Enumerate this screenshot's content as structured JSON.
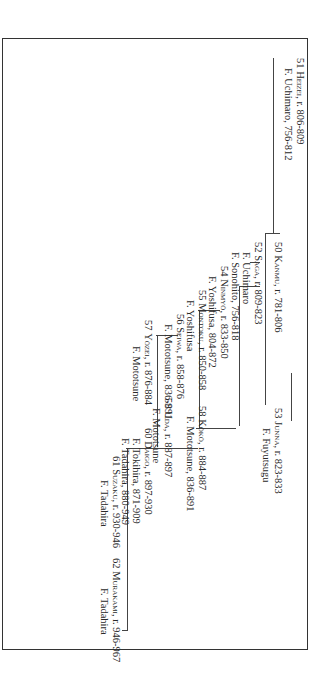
{
  "chart": {
    "rotation_deg": 90,
    "nodes": [
      {
        "id": "n50",
        "num": "50",
        "name": "Kanmu",
        "reign": "r. 781-806",
        "fujiwara": []
      },
      {
        "id": "n51",
        "num": "51",
        "name": "Heizei",
        "reign": "r. 806-809",
        "fujiwara": [
          "F. Uchimaro, 756-812"
        ]
      },
      {
        "id": "n52",
        "num": "52",
        "name": "Saga",
        "reign": "r. 809-823",
        "fujiwara": [
          "F. Uchimaro",
          "F. Sonohito, 756-818"
        ]
      },
      {
        "id": "n53",
        "num": "53",
        "name": "Junna",
        "reign": "r. 823-833",
        "fujiwara": [
          "F. Fuyutsugu"
        ]
      },
      {
        "id": "n54",
        "num": "54",
        "name": "Ninmyō",
        "reign": "r. 833-850",
        "fujiwara": [
          "F. Yoshifusa, 804-872"
        ]
      },
      {
        "id": "n55",
        "num": "55",
        "name": "Montoku",
        "reign": "r. 850-858",
        "fujiwara": [
          "F. Yoshifusa"
        ]
      },
      {
        "id": "n56",
        "num": "56",
        "name": "Seiwa",
        "reign": "r. 858-876",
        "fujiwara": [
          "F. Mototsune, 836-891"
        ]
      },
      {
        "id": "n57",
        "num": "57",
        "name": "Yōzei",
        "reign": "r. 876-884",
        "fujiwara": [
          "F. Mototsune"
        ]
      },
      {
        "id": "n58",
        "num": "58",
        "name": "Kōkō",
        "reign": "r. 884-887",
        "fujiwara": [
          "F. Mototsune, 836-891"
        ]
      },
      {
        "id": "n59",
        "num": "59",
        "name": "Uda",
        "reign": "r. 887-897",
        "fujiwara": [
          "F. Mototsune"
        ]
      },
      {
        "id": "n60",
        "num": "60",
        "name": "Daigo",
        "reign": "r. 897-930",
        "fujiwara": [
          "F. Tokihira, 871-909",
          "F. Tadahira, 880-949"
        ]
      },
      {
        "id": "n61",
        "num": "61",
        "name": "Suzaku",
        "reign": "r. 930-946",
        "fujiwara": [
          "F. Tadahira"
        ]
      },
      {
        "id": "n62",
        "num": "62",
        "name": "Murakami",
        "reign": "r. 946-967",
        "fujiwara": [
          "F. Tadahira"
        ]
      }
    ]
  }
}
